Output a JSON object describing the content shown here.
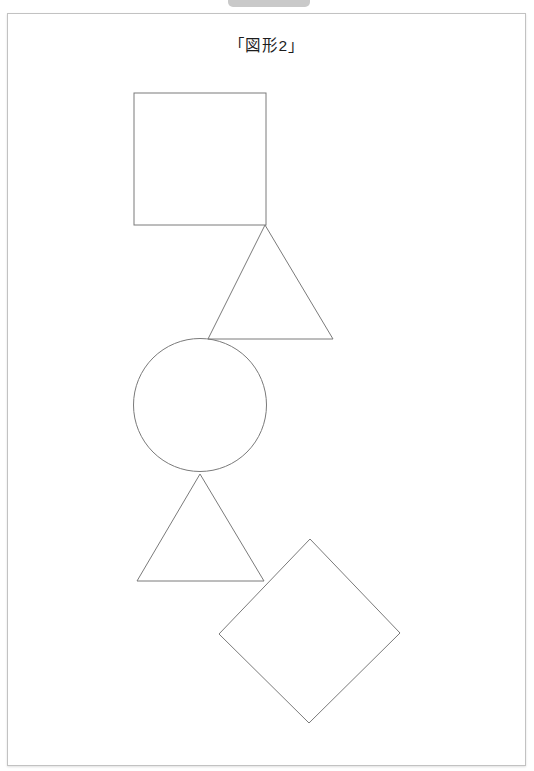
{
  "window": {
    "top_chip": {
      "name": "toolbar-chip",
      "color": "#c9c9c9"
    },
    "background_color": "#ffffff"
  },
  "page": {
    "title": "「図形2」",
    "border_color": "#c2c2c2",
    "background_color": "#ffffff",
    "width": 519,
    "height": 753
  },
  "figure": {
    "stroke_color": "#7a7a7a",
    "fill_color": "none",
    "stroke_width": 1,
    "shapes": [
      {
        "name": "square",
        "label": "square",
        "type": "rect",
        "x": 126,
        "y": 79,
        "width": 132,
        "height": 132
      },
      {
        "name": "triangle-upper",
        "label": "triangle",
        "type": "polygon",
        "points": "257,211 325,325 200,325"
      },
      {
        "name": "circle",
        "label": "circle",
        "type": "circle",
        "cx": 192,
        "cy": 391,
        "r": 66.5
      },
      {
        "name": "triangle-lower",
        "label": "triangle",
        "type": "polygon",
        "points": "192,460 256,567 129,567"
      },
      {
        "name": "diamond",
        "label": "diamond",
        "type": "polygon",
        "points": "302,525 392,619 301,709 211,620"
      }
    ]
  }
}
